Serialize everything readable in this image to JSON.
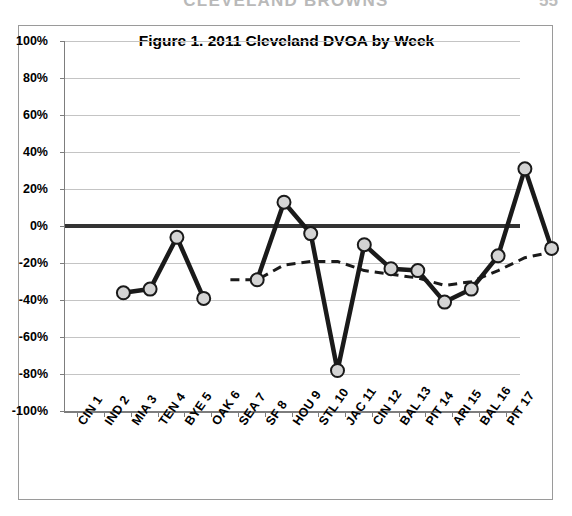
{
  "running_head": {
    "text": "CLEVELAND BROWNS",
    "page_number": "55"
  },
  "figure": {
    "title": "Figure 1. 2011 Cleveland DVOA by Week"
  },
  "chart_data": {
    "type": "line",
    "title": "Figure 1. 2011 Cleveland DVOA by Week",
    "xlabel": "",
    "ylabel": "",
    "ylim": [
      -100,
      100
    ],
    "ytick_step": 20,
    "grid": true,
    "legend_position": "none",
    "yticks": [
      "100%",
      "80%",
      "60%",
      "40%",
      "20%",
      "0%",
      "-20%",
      "-40%",
      "-60%",
      "-80%",
      "-100%"
    ],
    "ytick_values": [
      100,
      80,
      60,
      40,
      20,
      0,
      -20,
      -40,
      -60,
      -80,
      -100
    ],
    "categories": [
      "CIN 1",
      "IND 2",
      "MIA 3",
      "TEN 4",
      "BYE 5",
      "OAK 6",
      "SEA 7",
      "SF 8",
      "HOU 9",
      "STL 10",
      "JAC 11",
      "CIN 12",
      "BAL 13",
      "PIT 14",
      "ARI 15",
      "BAL 16",
      "PIT 17"
    ],
    "series": [
      {
        "name": "Weekly DVOA",
        "style": "solid-with-markers",
        "color": "#1a1a1a",
        "marker_fill": "#d4d4d4",
        "values": [
          -28,
          -26,
          2,
          -31,
          null,
          -21,
          21,
          4,
          -70,
          -2,
          -15,
          -16,
          -33,
          -26,
          -8,
          39,
          -4
        ]
      },
      {
        "name": "Cumulative DVOA",
        "style": "dashed",
        "color": "#1a1a1a",
        "values": [
          null,
          null,
          null,
          null,
          -21,
          -21,
          -13,
          -11,
          -11,
          -16,
          -18,
          -20,
          -24,
          -22,
          -16,
          -9,
          -6
        ]
      }
    ]
  }
}
